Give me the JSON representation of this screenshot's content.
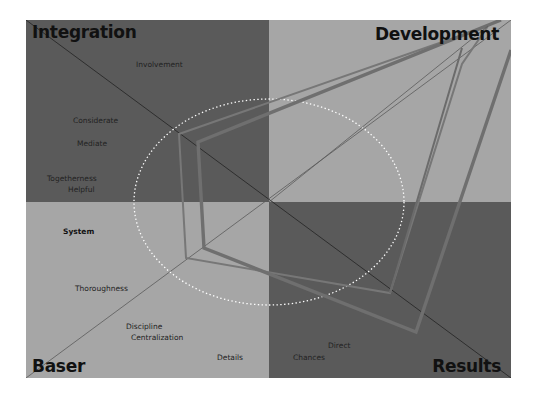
{
  "diagram": {
    "type": "quadrant-radar",
    "center": {
      "x": 243,
      "y": 182
    },
    "size": {
      "width": 485,
      "height": 358
    },
    "colors": {
      "background": "#ffffff",
      "dark_quadrant": "#5a5a5a",
      "light_quadrant": "#a6a6a6",
      "diagonal_line": "#2e2e2e",
      "polygon_outer": "#6d6d6d",
      "polygon_inner": "#777777",
      "ellipse_dotted": "#ffffff"
    },
    "quadrants": [
      {
        "name": "Integration",
        "position": "top-left",
        "color": "#5a5a5a"
      },
      {
        "name": "Development",
        "position": "top-right",
        "color": "#a6a6a6"
      },
      {
        "name": "Baser",
        "position": "bottom-left",
        "color": "#a6a6a6"
      },
      {
        "name": "Results",
        "position": "bottom-right",
        "color": "#5a5a5a"
      }
    ],
    "terms": [
      {
        "text": "Involvement",
        "x": 110,
        "y": 40,
        "bold": false
      },
      {
        "text": "Considerate",
        "x": 47,
        "y": 96,
        "bold": false
      },
      {
        "text": "Mediate",
        "x": 51,
        "y": 119,
        "bold": false
      },
      {
        "text": "Togetherness",
        "x": 21,
        "y": 154,
        "bold": false
      },
      {
        "text": "Helpful",
        "x": 42,
        "y": 165,
        "bold": false
      },
      {
        "text": "System",
        "x": 37,
        "y": 207,
        "bold": true
      },
      {
        "text": "Thoroughness",
        "x": 49,
        "y": 264,
        "bold": false
      },
      {
        "text": "Discipline",
        "x": 100,
        "y": 302,
        "bold": false
      },
      {
        "text": "Centralization",
        "x": 105,
        "y": 313,
        "bold": false
      },
      {
        "text": "Details",
        "x": 191,
        "y": 333,
        "bold": false
      },
      {
        "text": "Direct",
        "x": 302,
        "y": 321,
        "bold": false
      },
      {
        "text": "Chances",
        "x": 267,
        "y": 333,
        "bold": false
      }
    ],
    "polygons": [
      {
        "name": "profile-outer",
        "stroke_width": 3.2,
        "points": [
          [
            243,
            182
          ],
          [
            172,
            118
          ],
          [
            182,
            228
          ],
          [
            370,
            313
          ],
          [
            450,
            10
          ]
        ]
      },
      {
        "name": "profile-inner",
        "stroke_width": 2.0,
        "points": [
          [
            153,
            114
          ],
          [
            160,
            238
          ],
          [
            365,
            273
          ],
          [
            448,
            18
          ]
        ]
      }
    ]
  }
}
